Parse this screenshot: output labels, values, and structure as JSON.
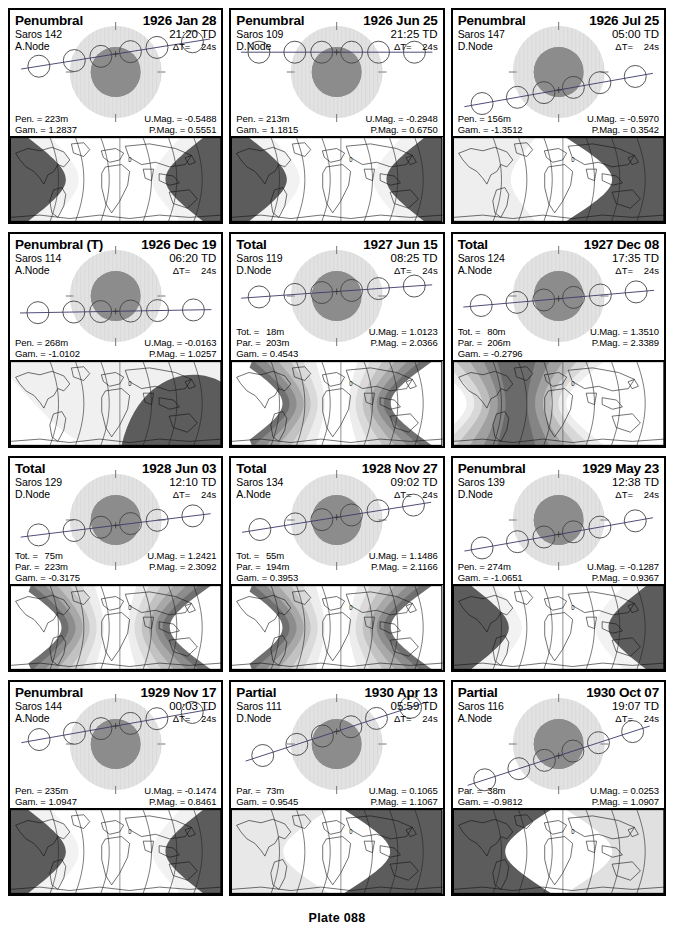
{
  "page": {
    "plate_label": "Plate 088",
    "columns": 3,
    "rows": 4,
    "colors": {
      "penumbra_shade": "#e2e2e2",
      "umbra_shade": "#8c8c8c",
      "map_dark": "#5c5c5c",
      "map_mid": "#9a9a9a",
      "map_light": "#d4d4d4",
      "map_white": "#ffffff",
      "outline": "#000000"
    },
    "labels": {
      "pen": "Pen. =",
      "tot": "Tot. =",
      "par": "Par. =",
      "gam": "Gam. =",
      "umag": "U.Mag. =",
      "pmag": "P.Mag. =",
      "dt": "ΔT=",
      "td_suffix": "TD"
    }
  },
  "panels": [
    {
      "type": "Penumbral",
      "date": "1926 Jan 28",
      "saros": "Saros 142",
      "node": "A.Node",
      "time": "21:20 TD",
      "dt": "24s",
      "pen": "223m",
      "tot": null,
      "par": null,
      "gam": "1.2837",
      "umag": "-0.5488",
      "pmag": "0.5551",
      "moon_path": {
        "y": 0.3,
        "angle": -9,
        "moons_above": true,
        "moon_y_offset": -40
      },
      "map_style": "penumbral-centered"
    },
    {
      "type": "Penumbral",
      "date": "1926 Jun 25",
      "saros": "Saros 109",
      "node": "D.Node",
      "time": "21:25 TD",
      "dt": "24s",
      "pen": "213m",
      "tot": null,
      "par": null,
      "gam": "1.1815",
      "umag": "-0.2948",
      "pmag": "0.6750",
      "moon_path": {
        "y": 0.3,
        "angle": 0,
        "moons_above": true,
        "moon_y_offset": -44
      },
      "map_style": "penumbral-centered"
    },
    {
      "type": "Penumbral",
      "date": "1926 Jul 25",
      "saros": "Saros 147",
      "node": "D.Node",
      "time": "05:00 TD",
      "dt": "24s",
      "pen": "156m",
      "tot": null,
      "par": null,
      "gam": "-1.3512",
      "umag": "-0.5970",
      "pmag": "0.3542",
      "moon_path": {
        "y": 0.5,
        "angle": -10,
        "moons_above": false,
        "moon_y_offset": 40
      },
      "map_style": "penumbral-west"
    },
    {
      "type": "Penumbral (T)",
      "date": "1926 Dec 19",
      "saros": "Saros 114",
      "node": "A.Node",
      "time": "06:20 TD",
      "dt": "24s",
      "pen": "268m",
      "tot": null,
      "par": null,
      "gam": "-1.0102",
      "umag": "-0.0163",
      "pmag": "1.0257",
      "moon_path": {
        "y": 0.46,
        "angle": -1,
        "moons_above": false,
        "moon_y_offset": 34
      },
      "map_style": "penumbral-east"
    },
    {
      "type": "Total",
      "date": "1927 Jun 15",
      "saros": "Saros 119",
      "node": "D.Node",
      "time": "08:25 TD",
      "dt": "24s",
      "pen": null,
      "tot": "18m",
      "par": "203m",
      "gam": "0.4543",
      "umag": "1.0123",
      "pmag": "2.0366",
      "moon_path": {
        "y": 0.5,
        "angle": -4,
        "moons_above": true,
        "moon_y_offset": -10
      },
      "map_style": "total-banded"
    },
    {
      "type": "Total",
      "date": "1927 Dec 08",
      "saros": "Saros 124",
      "node": "A.Node",
      "time": "17:35 TD",
      "dt": "24s",
      "pen": null,
      "tot": "80m",
      "par": "206m",
      "gam": "-0.2796",
      "umag": "1.3510",
      "pmag": "2.3389",
      "moon_path": {
        "y": 0.52,
        "angle": -5,
        "moons_above": false,
        "moon_y_offset": 6
      },
      "map_style": "total-banded-west"
    },
    {
      "type": "Total",
      "date": "1928 Jun 03",
      "saros": "Saros 129",
      "node": "D.Node",
      "time": "12:10 TD",
      "dt": "24s",
      "pen": null,
      "tot": "75m",
      "par": "223m",
      "gam": "-0.3175",
      "umag": "1.2421",
      "pmag": "2.3092",
      "moon_path": {
        "y": 0.56,
        "angle": -7,
        "moons_above": false,
        "moon_y_offset": 12
      },
      "map_style": "total-banded-center"
    },
    {
      "type": "Total",
      "date": "1928 Nov 27",
      "saros": "Saros 134",
      "node": "A.Node",
      "time": "09:02 TD",
      "dt": "24s",
      "pen": null,
      "tot": "55m",
      "par": "194m",
      "gam": "0.3953",
      "umag": "1.1486",
      "pmag": "2.1166",
      "moon_path": {
        "y": 0.44,
        "angle": -9,
        "moons_above": true,
        "moon_y_offset": -6
      },
      "map_style": "total-banded-center"
    },
    {
      "type": "Penumbral",
      "date": "1929 May 23",
      "saros": "Saros 139",
      "node": "D.Node",
      "time": "12:38 TD",
      "dt": "24s",
      "pen": "274m",
      "tot": null,
      "par": null,
      "gam": "-1.0651",
      "umag": "-0.1287",
      "pmag": "0.9367",
      "moon_path": {
        "y": 0.44,
        "angle": -10,
        "moons_above": false,
        "moon_y_offset": 32
      },
      "map_style": "penumbral-centered"
    },
    {
      "type": "Penumbral",
      "date": "1929 Nov 17",
      "saros": "Saros 144",
      "node": "A.Node",
      "time": "00:03 TD",
      "dt": "24s",
      "pen": "235m",
      "tot": null,
      "par": null,
      "gam": "1.0947",
      "umag": "-0.1474",
      "pmag": "0.8461",
      "moon_path": {
        "y": 0.46,
        "angle": -10,
        "moons_above": true,
        "moon_y_offset": -40
      },
      "map_style": "penumbral-centered"
    },
    {
      "type": "Partial",
      "date": "1930 Apr 13",
      "saros": "Saros 111",
      "node": "D.Node",
      "time": "05:59 TD",
      "dt": "24s",
      "pen": null,
      "tot": null,
      "par": "73m",
      "gam": "0.9545",
      "umag": "0.1065",
      "pmag": "1.1067",
      "moon_path": {
        "y": 0.42,
        "angle": -18,
        "moons_above": true,
        "moon_y_offset": -28
      },
      "map_style": "partial-east"
    },
    {
      "type": "Partial",
      "date": "1930 Oct 07",
      "saros": "Saros 116",
      "node": "A.Node",
      "time": "19:07 TD",
      "dt": "24s",
      "pen": null,
      "tot": null,
      "par": "38m",
      "gam": "-0.9812",
      "umag": "0.0253",
      "pmag": "1.0907",
      "moon_path": {
        "y": 0.5,
        "angle": -18,
        "moons_above": false,
        "moon_y_offset": 26
      },
      "map_style": "partial-west"
    }
  ]
}
